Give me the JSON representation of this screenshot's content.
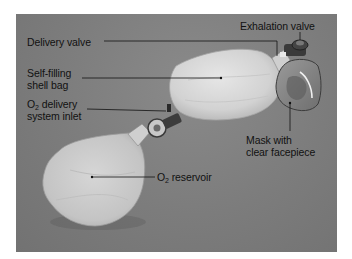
{
  "figure": {
    "labels": {
      "delivery_valve": "Delivery valve",
      "self_filling_line1": "Self-filling",
      "self_filling_line2": "shell bag",
      "o2_delivery_prefix": "O",
      "o2_delivery_sub": "2",
      "o2_delivery_line1_rest": " delivery",
      "o2_delivery_line2": "system inlet",
      "exhalation_valve": "Exhalation valve",
      "mask_line1": "Mask with",
      "mask_line2": "clear facepiece",
      "o2_reservoir_prefix": "O",
      "o2_reservoir_sub": "2",
      "o2_reservoir_rest": " reservoir"
    },
    "colors": {
      "background": "#7c7c7c",
      "bag": "#d9d9d9",
      "leader_line": "#111111"
    }
  }
}
